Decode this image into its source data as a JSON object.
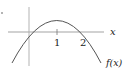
{
  "diagram": {
    "type": "function-graph",
    "function_label": "f(x)",
    "x_axis_label": "x",
    "ticks": [
      {
        "value": 1,
        "label": "1"
      },
      {
        "value": 2,
        "label": "2"
      }
    ],
    "curve": {
      "shape": "downward parabola",
      "roots": [
        0,
        2
      ],
      "vertex_x": 1
    },
    "colors": {
      "curve": "#555555",
      "axes": "#999999",
      "text": "#222222"
    }
  }
}
